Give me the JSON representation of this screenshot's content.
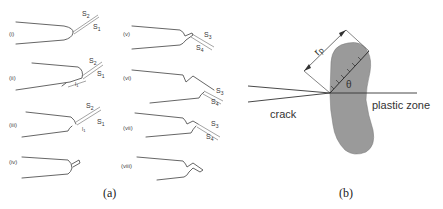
{
  "figure": {
    "panel_a": {
      "caption": "(a)",
      "steps": [
        {
          "label": "(i)",
          "planes": [
            "S2",
            "S1"
          ]
        },
        {
          "label": "(ii)",
          "planes": [
            "S2",
            "S1"
          ],
          "dimension": "l1"
        },
        {
          "label": "(iii)",
          "planes": [
            "S2",
            "S1"
          ],
          "dimension": "l1"
        },
        {
          "label": "(iv)",
          "planes": []
        },
        {
          "label": "(v)",
          "planes": [
            "S3",
            "S4"
          ]
        },
        {
          "label": "(vi)",
          "planes": [
            "S3",
            "S4"
          ]
        },
        {
          "label": "(vii)",
          "planes": [
            "S3",
            "S4"
          ]
        },
        {
          "label": "(viii)",
          "planes": []
        }
      ]
    },
    "panel_b": {
      "caption": "(b)",
      "labels": {
        "crack": "crack",
        "plastic_zone": "plastic zone",
        "radius": "rp",
        "angle": "θ"
      },
      "colors": {
        "zone_fill": "#9a9a9a",
        "line": "#333333"
      }
    }
  }
}
